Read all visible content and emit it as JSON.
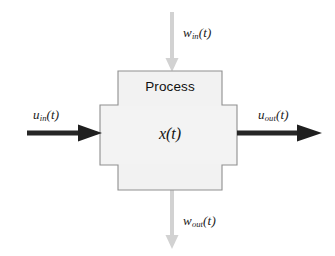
{
  "diagram": {
    "canvas": {
      "width": 335,
      "height": 256,
      "background": "#ffffff"
    },
    "block": {
      "name": "Process",
      "label": "Process",
      "state_label": "x(t)",
      "state_variable": "x",
      "fill_color": "#f2f2f2",
      "stroke_color": "#8c8c8c",
      "shape": "cross"
    },
    "signals": {
      "input_left": {
        "base": "u",
        "subscript": "in",
        "argument": "(t)",
        "label": "u_in(t)",
        "direction": "right",
        "color": "#1a1a1a",
        "style": "bold"
      },
      "output_right": {
        "base": "u",
        "subscript": "out",
        "argument": "(t)",
        "label": "u_out(t)",
        "direction": "right",
        "color": "#1a1a1a",
        "style": "bold"
      },
      "input_top": {
        "base": "w",
        "subscript": "in",
        "argument": "(t)",
        "label": "w_in(t)",
        "direction": "down",
        "color": "#cfcfcf",
        "style": "light"
      },
      "output_bottom": {
        "base": "w",
        "subscript": "out",
        "argument": "(t)",
        "label": "w_out(t)",
        "direction": "down",
        "color": "#cfcfcf",
        "style": "light"
      }
    }
  }
}
